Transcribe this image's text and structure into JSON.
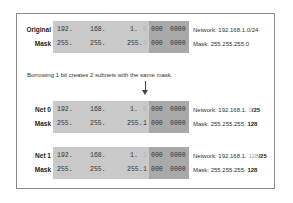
{
  "diagram": {
    "title": "",
    "original": {
      "rows": [
        {
          "label": "Original",
          "octets": [
            "192.",
            "168.",
            "1."
          ],
          "bit": "0",
          "bits_a": "000",
          "bits_b": "0000",
          "info_prefix": "Network: 192.168.1.0/24",
          "info_suffix": ""
        },
        {
          "label": "Mask",
          "octets": [
            "255.",
            "255.",
            "255."
          ],
          "bit": "0",
          "bits_a": "000",
          "bits_b": "0000",
          "info_prefix": "Mask: 255.255.255.0",
          "info_suffix": ""
        }
      ]
    },
    "caption": "Borrowing 1 bit creates 2 subnets with the same mask.",
    "subnets": [
      {
        "rows": [
          {
            "label": "Net 0",
            "octets": [
              "192.",
              "168.",
              "1."
            ],
            "bit": "0",
            "bits_a": "000",
            "bits_b": "0000",
            "info_prefix": "Network: 192.168.1. ",
            "info_dim": "0",
            "info_bold": "/25"
          },
          {
            "label": "Mask",
            "octets": [
              "255.",
              "255.",
              "255."
            ],
            "bit": "1",
            "bits_a": "000",
            "bits_b": "0000",
            "info_prefix": "Mask: 255.255.255. ",
            "info_dim": "",
            "info_bold": "128"
          }
        ]
      },
      {
        "rows": [
          {
            "label": "Net 1",
            "octets": [
              "192.",
              "168.",
              "1."
            ],
            "bit": "1",
            "bits_a": "000",
            "bits_b": "0000",
            "info_prefix": "Network: 192.168.1. ",
            "info_dim": "128",
            "info_bold": "/25"
          },
          {
            "label": "Mask",
            "octets": [
              "255.",
              "255.",
              "255."
            ],
            "bit": "1",
            "bits_a": "000",
            "bits_b": "0000",
            "info_prefix": "Mask: 255.255.255. ",
            "info_dim": "",
            "info_bold": "128"
          }
        ]
      }
    ],
    "colors": {
      "block_light": "#c9c9c9",
      "block_dark": "#a9a9a9",
      "frame_border": "#8a8a8a"
    }
  }
}
